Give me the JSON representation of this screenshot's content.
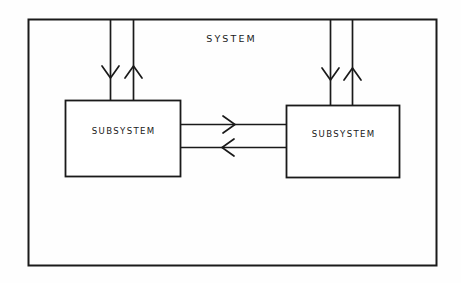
{
  "diagram": {
    "type": "block-diagram",
    "title": "SYSTEM",
    "background_color": "#fefefe",
    "stroke_color": "#1a1a1a",
    "system_boundary": {
      "label": "SYSTEM",
      "x": 28,
      "y": 19,
      "width": 409,
      "height": 247
    },
    "blocks": [
      {
        "id": "subsystem-left",
        "label": "SUBSYSTEM",
        "x": 65,
        "y": 100,
        "width": 116,
        "height": 77
      },
      {
        "id": "subsystem-right",
        "label": "SUBSYSTEM",
        "x": 286,
        "y": 105,
        "width": 114,
        "height": 73
      }
    ],
    "connectors": [
      {
        "id": "input-left",
        "direction": "down",
        "from": "system-boundary-top",
        "to": "subsystem-left",
        "x": 110,
        "y_start": 19,
        "y_end": 100
      },
      {
        "id": "output-left",
        "direction": "up",
        "from": "subsystem-left",
        "to": "system-boundary-top",
        "x": 133,
        "y_start": 100,
        "y_end": 19
      },
      {
        "id": "input-right",
        "direction": "down",
        "from": "system-boundary-top",
        "to": "subsystem-right",
        "x": 330,
        "y_start": 19,
        "y_end": 105
      },
      {
        "id": "output-right",
        "direction": "up",
        "from": "subsystem-right",
        "to": "system-boundary-top",
        "x": 352,
        "y_start": 105,
        "y_end": 19
      },
      {
        "id": "link-left-to-right",
        "direction": "right",
        "from": "subsystem-left",
        "to": "subsystem-right",
        "y": 124,
        "x_start": 181,
        "x_end": 286
      },
      {
        "id": "link-right-to-left",
        "direction": "left",
        "from": "subsystem-right",
        "to": "subsystem-left",
        "y": 147,
        "x_start": 286,
        "x_end": 181
      }
    ]
  }
}
